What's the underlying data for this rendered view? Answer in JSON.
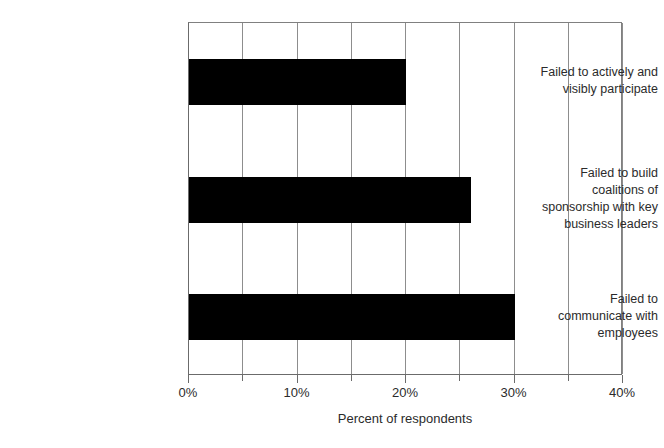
{
  "chart_data": {
    "type": "bar",
    "orientation": "horizontal",
    "title": "",
    "subtitle": "",
    "xlabel": "Percent of respondents",
    "ylabel": "",
    "categories": [
      "Failed to communicate with employees",
      "Failed to build coalitions of sponsorship with key business leaders",
      "Failed to actively and visibly participate"
    ],
    "category_lines": [
      [
        "Failed to",
        "communicate with",
        "employees"
      ],
      [
        "Failed to build",
        "coalitions of",
        "sponsorship with key",
        "business leaders"
      ],
      [
        "Failed to actively and",
        "visibly participate"
      ]
    ],
    "values": [
      30,
      26,
      20
    ],
    "value_labels": [
      "30%",
      "26%",
      "20%"
    ],
    "xlim": [
      0,
      40
    ],
    "ylim": [
      0,
      3
    ],
    "x_ticks": [
      0,
      5,
      10,
      15,
      20,
      25,
      30,
      35,
      40
    ],
    "x_tick_labels": [
      "0%",
      "",
      "10%",
      "",
      "20%",
      "",
      "30%",
      "",
      "40%"
    ],
    "x_major_ticks": [
      0,
      10,
      20,
      30,
      40
    ],
    "grid": {
      "vertical": true,
      "horizontal": false
    },
    "legend": {
      "visible": false,
      "position": "none",
      "entries": []
    },
    "bar_color": "#000000",
    "gridline_color": "#8d8d8d",
    "axis_color": "#6b6b6b",
    "text_color": "#2b2b2b",
    "background_color": "#ffffff"
  }
}
